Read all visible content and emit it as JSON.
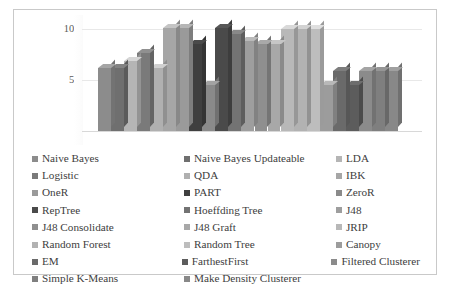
{
  "chart_data": {
    "type": "bar",
    "title": "",
    "xlabel": "",
    "ylabel": "",
    "ylim": [
      0,
      110
    ],
    "yticks": [
      0,
      50,
      100
    ],
    "ytick_labels": [
      "0",
      "50",
      "100"
    ],
    "grid": true,
    "legend_position": "bottom",
    "legend_columns": 3,
    "categories": [
      "Naive Bayes",
      "Naive Bayes Updateable",
      "LDA",
      "Logistic",
      "QDA",
      "IBK",
      "OneR",
      "PART",
      "ZeroR",
      "RepTree",
      "Hoeffding Tree",
      "J48",
      "J48 Consolidate",
      "J48 Graft",
      "JRIP",
      "Random Forest",
      "Random Tree",
      "Canopy",
      "EM",
      "FarthestFirst",
      "Filtered Clusterer",
      "Simple K-Means",
      "Make Density Clusterer"
    ],
    "values": [
      62,
      62,
      69,
      77,
      62,
      101,
      101,
      85,
      45,
      101,
      95,
      88,
      85,
      85,
      100,
      100,
      100,
      45,
      59,
      45,
      59,
      59,
      59
    ],
    "colors": [
      "#8c8c8c",
      "#6f6f6f",
      "#b5b5b5",
      "#7a7a7a",
      "#b0b0b0",
      "#a6a6a6",
      "#9a9a9a",
      "#3f3f3f",
      "#8a8a8a",
      "#4a4a4a",
      "#737373",
      "#9e9e9e",
      "#8f8f8f",
      "#a8a8a8",
      "#b8b8b8",
      "#b2b2b2",
      "#bdbdbd",
      "#9c9c9c",
      "#6a6a6a",
      "#5c5c5c",
      "#8b8b8b",
      "#7f7f7f",
      "#888888"
    ]
  },
  "legend": {
    "rows": [
      [
        {
          "label": "Naive Bayes",
          "color": "#8c8c8c"
        },
        {
          "label": "Naive Bayes Updateable",
          "color": "#6f6f6f"
        },
        {
          "label": "LDA",
          "color": "#b5b5b5"
        }
      ],
      [
        {
          "label": "Logistic",
          "color": "#7a7a7a"
        },
        {
          "label": "QDA",
          "color": "#b0b0b0"
        },
        {
          "label": "IBK",
          "color": "#a6a6a6"
        }
      ],
      [
        {
          "label": "OneR",
          "color": "#9a9a9a"
        },
        {
          "label": "PART",
          "color": "#3f3f3f"
        },
        {
          "label": "ZeroR",
          "color": "#8a8a8a"
        }
      ],
      [
        {
          "label": "RepTree",
          "color": "#4a4a4a"
        },
        {
          "label": "Hoeffding Tree",
          "color": "#737373"
        },
        {
          "label": "J48",
          "color": "#9e9e9e"
        }
      ],
      [
        {
          "label": "J48 Consolidate",
          "color": "#8f8f8f"
        },
        {
          "label": "J48 Graft",
          "color": "#a8a8a8"
        },
        {
          "label": "JRIP",
          "color": "#b8b8b8"
        }
      ],
      [
        {
          "label": "Random Forest",
          "color": "#b2b2b2"
        },
        {
          "label": "Random Tree",
          "color": "#bdbdbd"
        },
        {
          "label": "Canopy",
          "color": "#9c9c9c"
        }
      ],
      [
        {
          "label": "EM",
          "color": "#6a6a6a"
        },
        {
          "label": "FarthestFirst",
          "color": "#5c5c5c"
        },
        {
          "label": "Filtered Clusterer",
          "color": "#8b8b8b"
        }
      ],
      [
        {
          "label": "Simple K-Means",
          "color": "#7f7f7f"
        },
        {
          "label": "Make Density Clusterer",
          "color": "#888888"
        }
      ]
    ]
  }
}
